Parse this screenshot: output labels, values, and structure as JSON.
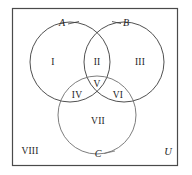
{
  "figure": {
    "name": "three-set-venn-diagram",
    "background_color": "#ffffff",
    "frame": {
      "label": "universal-set-rectangle",
      "stroke_color": "#4a4a4a",
      "x": 12,
      "y": 8,
      "width": 166,
      "height": 158
    }
  },
  "sets": [
    {
      "id": "A",
      "label": "A",
      "label_x": 62,
      "label_y": 23,
      "cx": 70,
      "cy": 62,
      "r": 40,
      "stroke_color": "#3c3c3c"
    },
    {
      "id": "B",
      "label": "B",
      "label_x": 126,
      "label_y": 23,
      "cx": 124,
      "cy": 62,
      "r": 40,
      "stroke_color": "#3c3c3c"
    },
    {
      "id": "C",
      "label": "C",
      "label_x": 98,
      "label_y": 154,
      "cx": 97,
      "cy": 115,
      "r": 39,
      "stroke_color": "#6e6e6e"
    }
  ],
  "regions": [
    {
      "id": "I",
      "label": "I",
      "x": 53,
      "y": 63,
      "meaning": "A only"
    },
    {
      "id": "II",
      "label": "II",
      "x": 97,
      "y": 63,
      "meaning": "A and B only"
    },
    {
      "id": "III",
      "label": "III",
      "x": 140,
      "y": 63,
      "meaning": "B only"
    },
    {
      "id": "IV",
      "label": "IV",
      "x": 77,
      "y": 96,
      "meaning": "A and C only"
    },
    {
      "id": "V",
      "label": "V",
      "x": 97,
      "y": 85,
      "meaning": "A and B and C"
    },
    {
      "id": "VI",
      "label": "VI",
      "x": 118,
      "y": 96,
      "meaning": "B and C only"
    },
    {
      "id": "VII",
      "label": "VII",
      "x": 98,
      "y": 122,
      "meaning": "C only"
    },
    {
      "id": "VIII",
      "label": "VIII",
      "x": 30,
      "y": 152,
      "meaning": "outside all sets"
    }
  ],
  "universe": {
    "label": "U",
    "x": 168,
    "y": 152
  },
  "leaders": [
    {
      "from_set": "A",
      "x1": 68,
      "y1": 24,
      "x2": 79,
      "y2": 22
    },
    {
      "from_set": "B",
      "x1": 113,
      "y1": 22,
      "x2": 121,
      "y2": 23
    },
    {
      "from_set": "C",
      "x1": 104,
      "y1": 154,
      "x2": 114,
      "y2": 152
    }
  ]
}
